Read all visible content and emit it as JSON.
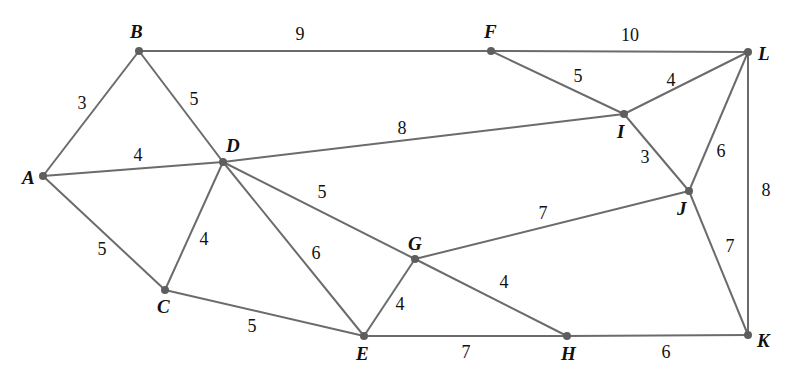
{
  "diagram": {
    "type": "weighted-undirected-graph",
    "nodes": [
      {
        "id": "A",
        "x": 43,
        "y": 176,
        "lx": 22,
        "ly": 184
      },
      {
        "id": "B",
        "x": 139,
        "y": 51,
        "lx": 130,
        "ly": 38
      },
      {
        "id": "C",
        "x": 165,
        "y": 290,
        "lx": 157,
        "ly": 313
      },
      {
        "id": "D",
        "x": 223,
        "y": 162,
        "lx": 226,
        "ly": 152
      },
      {
        "id": "E",
        "x": 364,
        "y": 336,
        "lx": 356,
        "ly": 360
      },
      {
        "id": "F",
        "x": 491,
        "y": 51,
        "lx": 484,
        "ly": 38
      },
      {
        "id": "G",
        "x": 415,
        "y": 259,
        "lx": 408,
        "ly": 250
      },
      {
        "id": "H",
        "x": 567,
        "y": 336,
        "lx": 561,
        "ly": 360
      },
      {
        "id": "I",
        "x": 624,
        "y": 114,
        "lx": 617,
        "ly": 138
      },
      {
        "id": "J",
        "x": 689,
        "y": 191,
        "lx": 677,
        "ly": 215
      },
      {
        "id": "K",
        "x": 748,
        "y": 335,
        "lx": 757,
        "ly": 347
      },
      {
        "id": "L",
        "x": 748,
        "y": 52,
        "lx": 758,
        "ly": 60
      }
    ],
    "edges": [
      {
        "from": "A",
        "to": "B",
        "weight": "3",
        "lx": 82,
        "ly": 109
      },
      {
        "from": "A",
        "to": "D",
        "weight": "4",
        "lx": 138,
        "ly": 161
      },
      {
        "from": "A",
        "to": "C",
        "weight": "5",
        "lx": 102,
        "ly": 255
      },
      {
        "from": "B",
        "to": "D",
        "weight": "5",
        "lx": 194,
        "ly": 105
      },
      {
        "from": "B",
        "to": "F",
        "weight": "9",
        "lx": 300,
        "ly": 40
      },
      {
        "from": "C",
        "to": "D",
        "weight": "4",
        "lx": 204,
        "ly": 245
      },
      {
        "from": "C",
        "to": "E",
        "weight": "5",
        "lx": 252,
        "ly": 332
      },
      {
        "from": "D",
        "to": "E",
        "weight": "6",
        "lx": 316,
        "ly": 259
      },
      {
        "from": "D",
        "to": "G",
        "weight": "5",
        "lx": 322,
        "ly": 198
      },
      {
        "from": "D",
        "to": "I",
        "weight": "8",
        "lx": 402,
        "ly": 134
      },
      {
        "from": "E",
        "to": "G",
        "weight": "4",
        "lx": 400,
        "ly": 310
      },
      {
        "from": "E",
        "to": "H",
        "weight": "7",
        "lx": 466,
        "ly": 358
      },
      {
        "from": "G",
        "to": "H",
        "weight": "4",
        "lx": 504,
        "ly": 288
      },
      {
        "from": "G",
        "to": "J",
        "weight": "7",
        "lx": 543,
        "ly": 219
      },
      {
        "from": "F",
        "to": "L",
        "weight": "10",
        "lx": 630,
        "ly": 41
      },
      {
        "from": "F",
        "to": "I",
        "weight": "5",
        "lx": 578,
        "ly": 82
      },
      {
        "from": "I",
        "to": "L",
        "weight": "4",
        "lx": 671,
        "ly": 86
      },
      {
        "from": "I",
        "to": "J",
        "weight": "3",
        "lx": 645,
        "ly": 163
      },
      {
        "from": "J",
        "to": "L",
        "weight": "6",
        "lx": 721,
        "ly": 157
      },
      {
        "from": "J",
        "to": "K",
        "weight": "7",
        "lx": 730,
        "ly": 252
      },
      {
        "from": "L",
        "to": "K",
        "weight": "8",
        "lx": 766,
        "ly": 196
      },
      {
        "from": "H",
        "to": "K",
        "weight": "6",
        "lx": 666,
        "ly": 358
      }
    ],
    "colors": {
      "edge": "#6b6b6b",
      "node": "#5e5e5e",
      "text": "#111111"
    }
  }
}
